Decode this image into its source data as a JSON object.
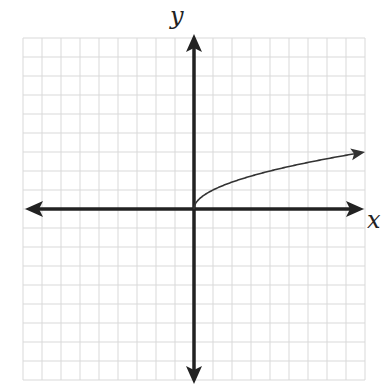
{
  "chart_data": {
    "type": "line",
    "title": "",
    "xlabel": "x",
    "ylabel": "y",
    "function": "y = sqrt(x)",
    "xlim": [
      -9,
      9
    ],
    "ylim": [
      -9,
      9
    ],
    "grid": true,
    "grid_step": 1,
    "legend": null,
    "series": [
      {
        "name": "sqrt(x)",
        "x": [
          0,
          0.25,
          1,
          2,
          4,
          6,
          9
        ],
        "values": [
          0,
          0.5,
          1,
          1.414,
          2,
          2.449,
          3
        ],
        "end_arrow": true
      }
    ]
  },
  "labels": {
    "x_axis": "x",
    "y_axis": "y"
  },
  "colors": {
    "axis": "#222222",
    "grid": "#d9d9d9",
    "curve": "#333333",
    "background": "#ffffff"
  }
}
